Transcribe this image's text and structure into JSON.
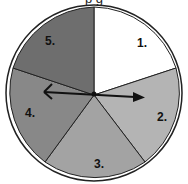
{
  "header": {
    "cropped_text": "p                                        g"
  },
  "spinner": {
    "sections": [
      {
        "label": "1.",
        "color": "#ffffff"
      },
      {
        "label": "2.",
        "color": "#b4b4b4"
      },
      {
        "label": "3.",
        "color": "#a3a3a3"
      },
      {
        "label": "4.",
        "color": "#888888"
      },
      {
        "label": "5.",
        "color": "#6e6e6e"
      }
    ],
    "arrow": "spinner-arrow"
  }
}
